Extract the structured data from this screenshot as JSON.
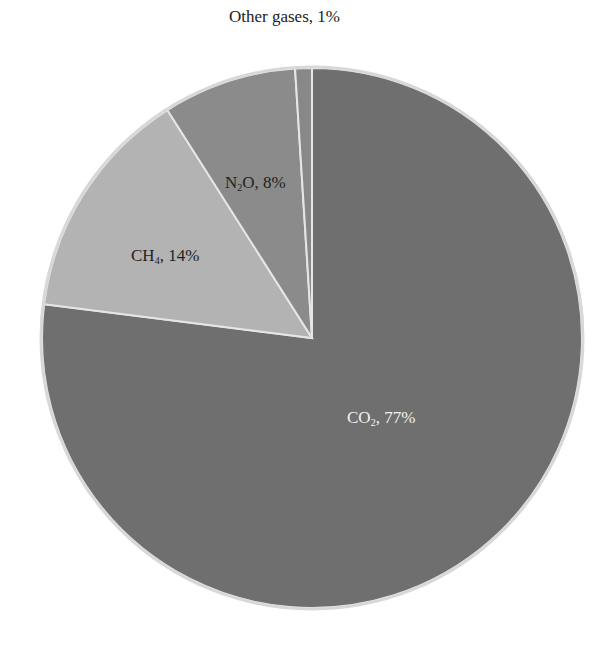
{
  "chart_data": {
    "type": "pie",
    "title": "",
    "start_angle_deg": 0,
    "direction": "clockwise",
    "slices": [
      {
        "key": "co2",
        "label": "CO2, 77%",
        "name": "CO2",
        "subscript": "2",
        "base": "CO",
        "value": 77,
        "color": "#6f6f6f",
        "label_color": "#ffffff"
      },
      {
        "key": "ch4",
        "label": "CH4, 14%",
        "name": "CH4",
        "subscript": "4",
        "base": "CH",
        "value": 14,
        "color": "#b3b3b3",
        "label_color": "#222222"
      },
      {
        "key": "n2o",
        "label": "N2O, 8%",
        "name": "N2O",
        "subscript": "2",
        "base": "N",
        "suffix": "O",
        "value": 8,
        "color": "#8b8b8b",
        "label_color": "#222222"
      },
      {
        "key": "other",
        "label": "Other gases, 1%",
        "name": "Other gases",
        "value": 1,
        "color": "#888888",
        "label_color": "#222222"
      }
    ],
    "legend": "none",
    "data_labels": true
  },
  "labels": {
    "co2": {
      "base": "CO",
      "sub": "2",
      "rest": ", 77%"
    },
    "ch4": {
      "base": "CH",
      "sub": "4",
      "rest": ", 14%"
    },
    "n2o": {
      "base": "N",
      "sub": "2",
      "rest": "O, 8%"
    },
    "other": {
      "text": "Other gases, 1%"
    }
  },
  "geometry": {
    "cx": 312,
    "cy": 338,
    "r": 270
  }
}
